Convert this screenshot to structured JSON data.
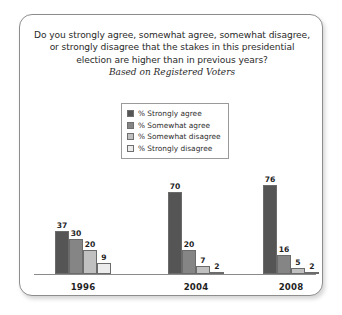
{
  "card": {
    "title_lines": [
      "Do you strongly agree, somewhat agree, somewhat disagree,",
      "or strongly disagree that the stakes in this presidential",
      "election are higher than in previous years?"
    ],
    "subtitle": "Based on Registered Voters"
  },
  "legend": {
    "items": [
      {
        "label": "% Strongly agree",
        "color": "#555555"
      },
      {
        "label": "% Somewhat agree",
        "color": "#858585"
      },
      {
        "label": "% Somewhat disagree",
        "color": "#c0c0c0"
      },
      {
        "label": "% Strongly disagree",
        "color": "#ececec"
      }
    ]
  },
  "chart_data": {
    "type": "bar",
    "title": "Do you strongly agree, somewhat agree, somewhat disagree, or strongly disagree that the stakes in this presidential election are higher than in previous years?",
    "subtitle": "Based on Registered Voters",
    "xlabel": "",
    "ylabel": "",
    "ylim": [
      0,
      80
    ],
    "grid": false,
    "legend_position": "top-center",
    "categories": [
      "1996",
      "2004",
      "2008"
    ],
    "series": [
      {
        "name": "% Strongly agree",
        "color": "#555555",
        "values": [
          37,
          30,
          76
        ]
      },
      {
        "name": "% Somewhat agree",
        "color": "#858585",
        "values": [
          30,
          20,
          16
        ]
      },
      {
        "name": "% Somewhat disagree",
        "color": "#c0c0c0",
        "values": [
          20,
          7,
          5
        ]
      },
      {
        "name": "% Strongly disagree",
        "color": "#ececec",
        "values": [
          9,
          2,
          2
        ]
      }
    ],
    "groups": [
      {
        "label": "1996",
        "values": [
          37,
          30,
          20,
          9
        ]
      },
      {
        "label": "2004",
        "values": [
          70,
          20,
          7,
          2
        ]
      },
      {
        "label": "2008",
        "values": [
          76,
          16,
          5,
          2
        ]
      }
    ]
  }
}
